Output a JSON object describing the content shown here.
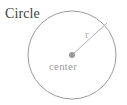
{
  "figure": {
    "kind": "geometry-diagram",
    "subject": "circle",
    "background_color": "#ffffff",
    "stroke_color": "#9b9b9b",
    "labels": {
      "shape_label": "Circle",
      "radius_label": "r",
      "center_label": "center"
    },
    "label_colors": {
      "shape_label": "#3f3f3f",
      "radius_label": "#a8a8a8",
      "center_label": "#a0a0a0"
    },
    "geometry": {
      "circle_center_x": 72,
      "circle_center_y": 55,
      "circle_radius": 44,
      "center_dot_radius": 3,
      "radius_line_end_x": 107,
      "radius_line_end_y": 23
    }
  }
}
